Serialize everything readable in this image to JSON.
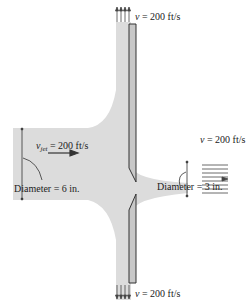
{
  "diagram": {
    "colors": {
      "fluid": "#dcdcdc",
      "plate": "#c8c8c8",
      "line": "#333333",
      "arrow": "#444444"
    },
    "labels": {
      "top_velocity": {
        "symbol": "v",
        "text": " = 200 ft/s"
      },
      "bottom_velocity": {
        "symbol": "v",
        "text": " = 200 ft/s"
      },
      "right_velocity": {
        "symbol": "v",
        "text": " = 200 ft/s"
      },
      "jet_velocity": {
        "symbol": "v",
        "subscript": "jet",
        "text": " = 200 ft/s"
      },
      "left_diameter": "Diameter = 6 in.",
      "right_diameter": "Diameter = 3 in."
    }
  }
}
